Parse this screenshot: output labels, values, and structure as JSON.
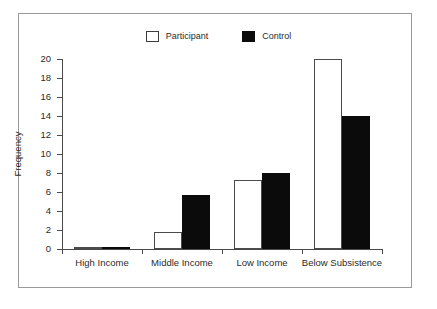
{
  "chart_data": {
    "type": "bar",
    "title": "",
    "xlabel": "",
    "ylabel": "Frequency",
    "categories": [
      "High Income",
      "Middle Income",
      "Low Income",
      "Below Subsistence"
    ],
    "series": [
      {
        "name": "Participant",
        "values": [
          0.2,
          1.8,
          7.3,
          20
        ],
        "fill": "#ffffff",
        "edge": "#4a4a4a"
      },
      {
        "name": "Control",
        "values": [
          0.2,
          5.7,
          8.0,
          14
        ],
        "fill": "#0b0b0b",
        "edge": "#0b0b0b"
      }
    ],
    "ylim": [
      0,
      20
    ],
    "yticks": [
      0,
      2,
      4,
      6,
      8,
      10,
      12,
      14,
      16,
      18,
      20
    ],
    "ytick_labels": [
      "0",
      "2",
      "4",
      "6",
      "8",
      "10",
      "12",
      "14",
      "16",
      "18",
      "20"
    ],
    "grid": false,
    "legend_position": "top-center",
    "frame": true
  },
  "legend": {
    "entries": [
      {
        "label": "Participant",
        "swatch": "open-square-swatch"
      },
      {
        "label": "Control",
        "swatch": "filled-square-swatch"
      }
    ]
  },
  "colors": {
    "participant": "#ffffff",
    "control": "#0b0b0b",
    "axis": "#4a4a4a",
    "frame": "#9a9a9a",
    "text": "#2b2b2b",
    "background": "#ffffff"
  }
}
